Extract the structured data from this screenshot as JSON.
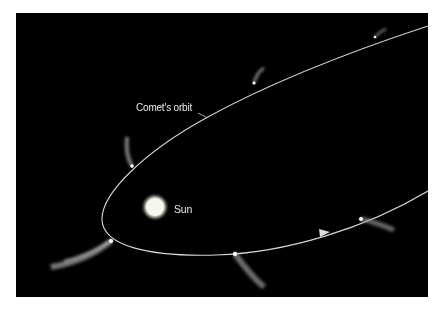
{
  "diagram": {
    "type": "astronomy-orbit-illustration",
    "background_color": "#000000",
    "labels": {
      "orbit": "Comet's orbit",
      "sun": "Sun"
    },
    "bodies": {
      "sun": {
        "name": "Sun",
        "cx": 139,
        "cy": 194,
        "r": 10,
        "color": "#f4f4ee"
      }
    },
    "orbit": {
      "color": "#d8d8d8",
      "shape": "elongated ellipse",
      "direction": "counterclockwise (arrow on lower branch points right)"
    },
    "comet_positions": [
      {
        "id": 1,
        "x": 359,
        "y": 24,
        "tail": "short, pointing away from Sun"
      },
      {
        "id": 2,
        "x": 238,
        "y": 70,
        "tail": "short, pointing up-right"
      },
      {
        "id": 3,
        "x": 116,
        "y": 153,
        "tail": "medium, pointing up"
      },
      {
        "id": 4,
        "x": 95,
        "y": 228,
        "tail": "long, pointing down-left"
      },
      {
        "id": 5,
        "x": 219,
        "y": 241,
        "tail": "medium, pointing down-right"
      },
      {
        "id": 6,
        "x": 345,
        "y": 206,
        "tail": "medium, pointing right"
      }
    ],
    "direction_arrow": {
      "x": 309,
      "y": 219
    }
  }
}
